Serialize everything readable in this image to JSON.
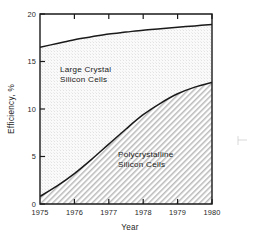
{
  "chart_data": {
    "type": "area",
    "title": "",
    "subtitle": "",
    "xlabel": "Year",
    "ylabel": "Efficiency, %",
    "xlim": [
      1975,
      1980
    ],
    "ylim": [
      0,
      20
    ],
    "grid": false,
    "legend_position": "inline-annotations",
    "x_ticks": [
      "1975",
      "1976",
      "1977",
      "1978",
      "1979",
      "1980"
    ],
    "x_tick_values": [
      1975,
      1976,
      1977,
      1978,
      1979,
      1980
    ],
    "y_ticks": [
      "0",
      "5",
      "10",
      "15",
      "20"
    ],
    "y_tick_values": [
      0,
      5,
      10,
      15,
      20
    ],
    "x": [
      1975,
      1975.5,
      1976,
      1976.5,
      1977,
      1977.5,
      1978,
      1978.5,
      1979,
      1979.5,
      1980
    ],
    "series": [
      {
        "name": "Large Crystal Silicon Cells",
        "label_line1": "Large Crystal",
        "label_line2": "Silicon Cells",
        "fill": "stipple-light",
        "fill_color": "#f1f1f1",
        "line_color": "#1a1a1a",
        "values": [
          16.5,
          16.9,
          17.3,
          17.6,
          17.9,
          18.1,
          18.3,
          18.45,
          18.6,
          18.75,
          18.9
        ]
      },
      {
        "name": "Polycrystalline Silicon Cells",
        "label_line1": "Polycrystalline",
        "label_line2": "Silicon Cells",
        "fill": "diagonal-hatch",
        "fill_color": "#d9d9d9",
        "line_color": "#1a1a1a",
        "values": [
          0.8,
          1.9,
          3.2,
          4.7,
          6.3,
          7.9,
          9.4,
          10.6,
          11.6,
          12.3,
          12.8
        ]
      }
    ],
    "annotations": [
      {
        "text": "Large Crystal Silicon Cells",
        "x": 1976.6,
        "y": 13.6
      },
      {
        "text": "Polycrystalline Silicon Cells",
        "x": 1978.5,
        "y": 4.8
      }
    ]
  },
  "axes": {
    "y_axis_title": "Efficiency, %",
    "x_axis_title": "Year"
  },
  "colors": {
    "axis": "#1a1a1a",
    "curve": "#1a1a1a",
    "upper_fill": "#f1f1f1",
    "lower_fill": "#d9d9d9",
    "background": "#ffffff",
    "crop_mark": "#c9c9c9"
  },
  "marks": {
    "crop_mark_label": "crop-mark"
  }
}
